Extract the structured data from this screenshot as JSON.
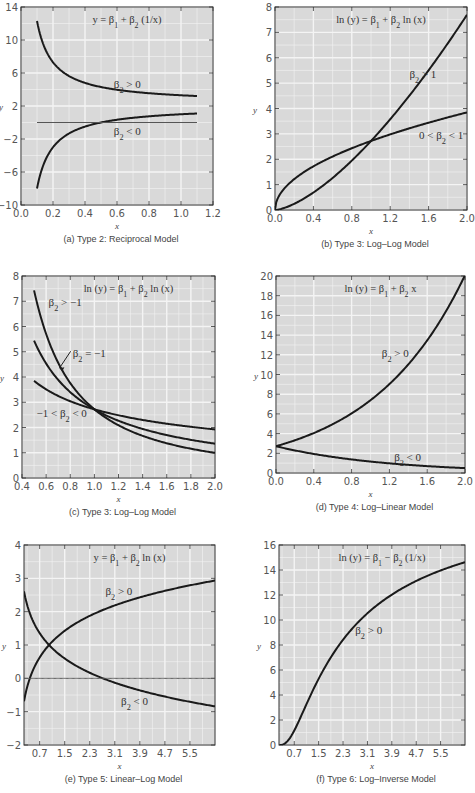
{
  "chart_data": [
    {
      "id": "a",
      "type": "line",
      "title": "y = β1 + β2 (1/x)",
      "caption": "(a) Type 2: Reciprocal Model",
      "xlabel": "x",
      "ylabel": "y",
      "xlim": [
        0.0,
        1.2
      ],
      "ylim": [
        -10,
        14
      ],
      "xticks": [
        0.0,
        0.2,
        0.4,
        0.6,
        0.8,
        1.0,
        1.2
      ],
      "xtick_labels": [
        "0.0",
        "0.2",
        "0.4",
        "0.6",
        "0.8",
        "1.0",
        "1.2"
      ],
      "yticks": [
        -10,
        -6,
        -2,
        2,
        6,
        10,
        14
      ],
      "ytick_labels": [
        "−10",
        "−6",
        "−2",
        "2",
        "6",
        "10",
        "14"
      ],
      "grid": true,
      "frame": [
        21,
        7,
        213,
        205
      ],
      "series": [
        {
          "name": "β2 > 0",
          "fn": "recip",
          "b1": 2.3,
          "b2": 1.0,
          "x": [
            0.1,
            1.1
          ]
        },
        {
          "name": "β2 < 0",
          "fn": "recip",
          "b1": 2.0,
          "b2": -1.0,
          "x": [
            0.1,
            1.1
          ]
        },
        {
          "name": "y = 0",
          "fn": "const",
          "b1": 0,
          "x": [
            0.1,
            1.1
          ],
          "thin": true
        }
      ],
      "annotations": [
        {
          "text": "β2 > 0",
          "x": 0.58,
          "y": 4.2
        },
        {
          "text": "β2 < 0",
          "x": 0.58,
          "y": -1.5
        }
      ]
    },
    {
      "id": "b",
      "type": "line",
      "title": "ln (y) = β1 + β2 ln (x)",
      "caption": "(b) Type 3: Log–Log Model",
      "xlabel": "x",
      "ylabel": "y",
      "xlim": [
        0.0,
        2.0
      ],
      "ylim": [
        0,
        8
      ],
      "xticks": [
        0.0,
        0.4,
        0.8,
        1.2,
        1.6,
        2.0
      ],
      "xtick_labels": [
        "0.0",
        "0.4",
        "0.8",
        "1.2",
        "1.6",
        "2.0"
      ],
      "yticks": [
        0,
        1,
        2,
        3,
        4,
        5,
        6,
        7,
        8
      ],
      "ytick_labels": [
        "0",
        "1",
        "2",
        "3",
        "4",
        "5",
        "6",
        "7",
        "8"
      ],
      "grid": true,
      "frame": [
        275,
        7,
        467,
        210
      ],
      "series": [
        {
          "name": "β2 > 1",
          "fn": "power",
          "b1": 2.72,
          "b2": 1.5,
          "x": [
            0.0,
            2.0
          ]
        },
        {
          "name": "0 < β2 < 1",
          "fn": "power",
          "b1": 2.72,
          "b2": 0.5,
          "x": [
            0.0,
            2.0
          ]
        }
      ],
      "annotations": [
        {
          "text": "β2 > 1",
          "x": 1.4,
          "y": 5.2
        },
        {
          "text": "0 < β2 < 1",
          "x": 1.5,
          "y": 2.8
        }
      ]
    },
    {
      "id": "c",
      "type": "line",
      "title": "ln (y) = β1 + β2 ln (x)",
      "caption": "(c) Type 3: Log–Log Model",
      "xlabel": "x",
      "ylabel": "y",
      "xlim": [
        0.4,
        2.0
      ],
      "ylim": [
        0,
        8
      ],
      "xticks": [
        0.4,
        0.6,
        0.8,
        1.0,
        1.2,
        1.4,
        1.6,
        1.8,
        2.0
      ],
      "xtick_labels": [
        "0.4",
        "0.6",
        "0.8",
        "1.0",
        "1.2",
        "1.4",
        "1.6",
        "1.8",
        "2.0"
      ],
      "yticks": [
        0,
        1,
        2,
        3,
        4,
        5,
        6,
        7,
        8
      ],
      "ytick_labels": [
        "0",
        "1",
        "2",
        "3",
        "4",
        "5",
        "6",
        "7",
        "8"
      ],
      "grid": true,
      "frame": [
        22,
        276,
        215,
        478
      ],
      "series": [
        {
          "name": "β2 > −1",
          "fn": "power",
          "b1": 2.72,
          "b2": -1.45,
          "x": [
            0.5,
            2.0
          ]
        },
        {
          "name": "β2 = −1",
          "fn": "power",
          "b1": 2.72,
          "b2": -1.0,
          "x": [
            0.5,
            2.0
          ]
        },
        {
          "name": "−1 < β2 < 0",
          "fn": "power",
          "b1": 2.72,
          "b2": -0.5,
          "x": [
            0.5,
            2.0
          ]
        }
      ],
      "annotations": [
        {
          "text": "β2 > −1",
          "x": 0.62,
          "y": 6.8
        },
        {
          "text": "β2 = −1",
          "x": 0.82,
          "y": 4.8
        },
        {
          "text": "−1 < β2 < 0",
          "x": 0.52,
          "y": 2.4
        }
      ]
    },
    {
      "id": "d",
      "type": "line",
      "title": "ln (y) = β1 + β2 x",
      "caption": "(d) Type 4: Log–Linear Model",
      "xlabel": "x",
      "ylabel": "y",
      "xlim": [
        0.0,
        2.0
      ],
      "ylim": [
        0,
        20
      ],
      "xticks": [
        0.0,
        0.4,
        0.8,
        1.2,
        1.6,
        2.0
      ],
      "xtick_labels": [
        "0.0",
        "0.4",
        "0.8",
        "1.2",
        "1.6",
        "2.0"
      ],
      "yticks": [
        0,
        2,
        4,
        6,
        8,
        10,
        12,
        14,
        16,
        18,
        20
      ],
      "ytick_labels": [
        "0",
        "2",
        "4",
        "6",
        "8",
        "10",
        "12",
        "14",
        "16",
        "18",
        "20"
      ],
      "grid": true,
      "frame": [
        276,
        276,
        465,
        473
      ],
      "series": [
        {
          "name": "β2 > 0",
          "fn": "exp",
          "b1": 1.0,
          "b2": 1.0,
          "x": [
            0.0,
            2.0
          ]
        },
        {
          "name": "β2 < 0",
          "fn": "exp",
          "b1": 1.0,
          "b2": -0.85,
          "x": [
            0.0,
            2.0
          ]
        }
      ],
      "annotations": [
        {
          "text": "β2 > 0",
          "x": 1.12,
          "y": 11.8
        },
        {
          "text": "β2 < 0",
          "x": 1.25,
          "y": 1.2
        }
      ]
    },
    {
      "id": "e",
      "type": "line",
      "title": "y = β1 + β2 ln (x)",
      "caption": "(e) Type 5: Linear–Log Model",
      "xlabel": "x",
      "ylabel": "y",
      "xlim": [
        0.2,
        6.3
      ],
      "ylim": [
        -2,
        4
      ],
      "xticks": [
        0.7,
        1.5,
        2.3,
        3.1,
        3.9,
        4.7,
        5.5
      ],
      "xtick_labels": [
        "0.7",
        "1.5",
        "2.3",
        "3.1",
        "3.9",
        "4.7",
        "5.5"
      ],
      "yticks": [
        -2,
        -1,
        0,
        1,
        2,
        3,
        4
      ],
      "ytick_labels": [
        "−2",
        "−1",
        "0",
        "1",
        "2",
        "3",
        "4"
      ],
      "grid": true,
      "frame": [
        24,
        545,
        215,
        745
      ],
      "series": [
        {
          "name": "β2 > 0",
          "fn": "linlog",
          "b1": 1.0,
          "b2": 1.05,
          "x": [
            0.2,
            6.3
          ]
        },
        {
          "name": "β2 < 0",
          "fn": "linlog",
          "b1": 1.0,
          "b2": -1.0,
          "x": [
            0.2,
            6.3
          ]
        },
        {
          "name": "y = 0",
          "fn": "const",
          "b1": 0,
          "x": [
            0.2,
            6.3
          ],
          "thin": true
        }
      ],
      "annotations": [
        {
          "text": "β2 > 0",
          "x": 2.8,
          "y": 2.5
        },
        {
          "text": "β2 < 0",
          "x": 3.3,
          "y": -0.8
        }
      ]
    },
    {
      "id": "f",
      "type": "line",
      "title": "ln (y) = β1 − β2 (1/x)",
      "caption": "(f) Type 6: Log–Inverse Model",
      "xlabel": "x",
      "ylabel": "y",
      "xlim": [
        0.2,
        6.3
      ],
      "ylim": [
        0,
        16
      ],
      "xticks": [
        0.7,
        1.5,
        2.3,
        3.1,
        3.9,
        4.7,
        5.5
      ],
      "xtick_labels": [
        "0.7",
        "1.5",
        "2.3",
        "3.1",
        "3.9",
        "4.7",
        "5.5"
      ],
      "yticks": [
        0,
        2,
        4,
        6,
        8,
        10,
        12,
        14,
        16
      ],
      "ytick_labels": [
        "0",
        "2",
        "4",
        "6",
        "8",
        "10",
        "12",
        "14",
        "16"
      ],
      "grid": true,
      "frame": [
        279,
        545,
        465,
        745
      ],
      "series": [
        {
          "name": "β2 > 0",
          "fn": "loginv",
          "b1": 3.0,
          "b2": 2.0,
          "x": [
            0.22,
            6.3
          ]
        }
      ],
      "annotations": [
        {
          "text": "β2 > 0",
          "x": 2.7,
          "y": 8.9
        }
      ]
    }
  ]
}
